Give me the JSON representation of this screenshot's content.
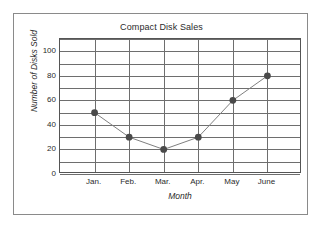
{
  "figure": {
    "border_color": "#8a8a8a",
    "background": "#ffffff"
  },
  "chart_data": {
    "type": "line",
    "title": "Compact Disk Sales",
    "xlabel": "Month",
    "ylabel": "Number of Disks Sold",
    "categories": [
      "Jan.",
      "Feb.",
      "Mar.",
      "Apr.",
      "May",
      "June"
    ],
    "values": [
      50,
      30,
      20,
      30,
      60,
      80
    ],
    "series": [
      {
        "name": "Number of Disks Sold",
        "values": [
          50,
          30,
          20,
          30,
          60,
          80
        ]
      }
    ],
    "ylim": [
      0,
      110
    ],
    "ytick_labels": [
      "0",
      "20",
      "40",
      "60",
      "80",
      "100"
    ],
    "ytick_values": [
      0,
      20,
      40,
      60,
      80,
      100
    ],
    "y_gridline_values": [
      0,
      10,
      20,
      30,
      40,
      50,
      60,
      70,
      80,
      90,
      100,
      110
    ],
    "y_minor_step": 10,
    "x_gridline_count": 8,
    "grid": true,
    "legend": "none",
    "marker": "circle",
    "marker_color": "#4a4a4a",
    "line_color": "#808080",
    "grid_color": "#6e6e6e",
    "axis_color": "#555555",
    "text_color": "#2b2b2b"
  }
}
